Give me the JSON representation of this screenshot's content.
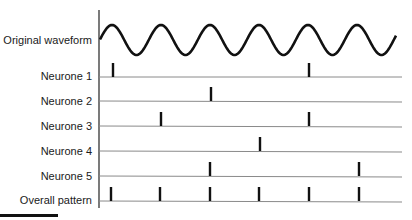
{
  "diagram": {
    "rows": [
      {
        "label": "Original waveform",
        "type": "waveform"
      },
      {
        "label": "Neurone 1",
        "spikes": [
          113,
          309
        ]
      },
      {
        "label": "Neurone 2",
        "spikes": [
          211
        ]
      },
      {
        "label": "Neurone 3",
        "spikes": [
          161,
          309
        ]
      },
      {
        "label": "Neurone 4",
        "spikes": [
          260
        ]
      },
      {
        "label": "Neurone 5",
        "spikes": [
          210,
          359
        ]
      },
      {
        "label": "Overall pattern",
        "spikes": [
          111,
          160,
          210,
          259,
          309,
          359
        ]
      }
    ],
    "waveform": {
      "x_start": 100,
      "x_end": 396,
      "center_y": 40,
      "amplitude": 15,
      "period": 49,
      "first_peak_x": 112
    },
    "colors": {
      "ink": "#111111",
      "baseline": "#8a8a8a",
      "axis": "#222222"
    }
  }
}
